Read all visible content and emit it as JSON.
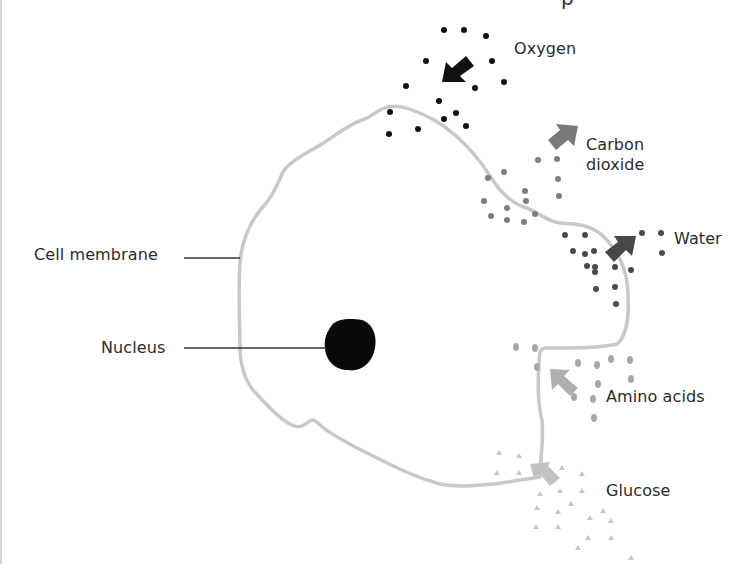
{
  "diagram": {
    "top_clipped_glyph": "p",
    "labels": {
      "cell_membrane": "Cell membrane",
      "nucleus": "Nucleus",
      "oxygen": "Oxygen",
      "carbon_dioxide": "Carbon dioxide",
      "carbon_dioxide_line1": "Carbon",
      "carbon_dioxide_line2": "dioxide",
      "water": "Water",
      "amino_acids": "Amino acids",
      "glucose": "Glucose"
    },
    "substances": [
      {
        "name": "Oxygen",
        "direction": "into cell",
        "particle": "dot",
        "color": "#111111"
      },
      {
        "name": "Carbon dioxide",
        "direction": "out of cell",
        "particle": "dot",
        "color": "#808080"
      },
      {
        "name": "Water",
        "direction": "out of cell",
        "particle": "dot",
        "color": "#4a4a4a"
      },
      {
        "name": "Amino acids",
        "direction": "into cell",
        "particle": "oval",
        "color": "#a8a8a8"
      },
      {
        "name": "Glucose",
        "direction": "into cell",
        "particle": "triangle",
        "color": "#c4c4c4"
      }
    ],
    "colors": {
      "membrane": "#c8c8c8",
      "nucleus": "#0a0a0a",
      "leader_line": "#333333",
      "oxygen": "#111111",
      "carbon_dioxide": "#7a7a7a",
      "water": "#4a4a4a",
      "amino_acids": "#a8a8a8",
      "glucose": "#c6c6c6"
    }
  }
}
